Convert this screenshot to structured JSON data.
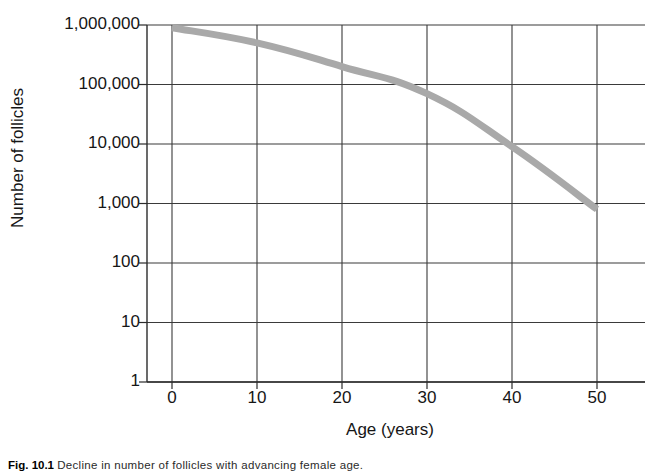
{
  "chart_data": {
    "type": "line",
    "title": "",
    "xlabel": "Age (years)",
    "ylabel": "Number of follicles",
    "x": [
      0,
      10,
      20,
      30,
      40,
      50
    ],
    "xticklabels": [
      "0",
      "10",
      "20",
      "30",
      "40",
      "50"
    ],
    "yticklabels": [
      "1",
      "10",
      "100",
      "1,000",
      "10,000",
      "100,000",
      "1,000,000"
    ],
    "ytickvalues": [
      1,
      10,
      100,
      1000,
      10000,
      100000,
      1000000
    ],
    "yscale": "log",
    "ylim": [
      1,
      1000000
    ],
    "xlim": [
      -2,
      56
    ],
    "grid": true,
    "legend": false,
    "series": [
      {
        "name": "Number of follicles",
        "color": "#a9a9a9",
        "linewidth": 7,
        "values": [
          900000,
          500000,
          200000,
          70000,
          9000,
          800
        ]
      }
    ]
  },
  "axes": {
    "ylabel_text": "Number of follicles",
    "xlabel_text": "Age (years)",
    "yticks": [
      {
        "label": "1,000,000",
        "value": 1000000
      },
      {
        "label": "100,000",
        "value": 100000
      },
      {
        "label": "10,000",
        "value": 10000
      },
      {
        "label": "1,000",
        "value": 1000
      },
      {
        "label": "100",
        "value": 100
      },
      {
        "label": "10",
        "value": 10
      },
      {
        "label": "1",
        "value": 1
      }
    ],
    "xticks": [
      {
        "label": "0",
        "value": 0
      },
      {
        "label": "10",
        "value": 10
      },
      {
        "label": "20",
        "value": 20
      },
      {
        "label": "30",
        "value": 30
      },
      {
        "label": "40",
        "value": 40
      },
      {
        "label": "50",
        "value": 50
      }
    ]
  },
  "caption": {
    "figure_number": "Fig. 10.1",
    "text": "Decline in number of follicles with advancing female age."
  },
  "colors": {
    "curve": "#a9a9a9",
    "axis": "#2b2b2b",
    "grid": "#3a3a3a",
    "text": "#161616",
    "background": "#ffffff"
  }
}
